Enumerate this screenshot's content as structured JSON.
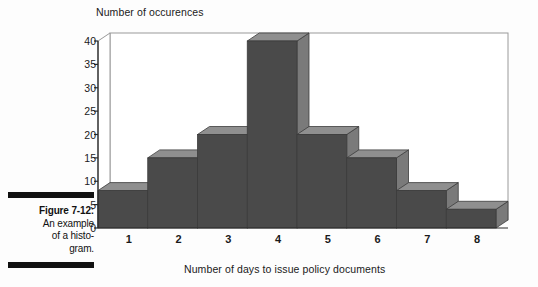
{
  "figure": {
    "label": "Figure 7-12:",
    "line1": "An example",
    "line2": "of a histo-",
    "line3": "gram."
  },
  "chart_data": {
    "type": "bar",
    "title": "",
    "subtitle": "",
    "xlabel": "Number of days to issue policy documents",
    "ylabel": "Number of occurences",
    "categories": [
      "1",
      "2",
      "3",
      "4",
      "5",
      "6",
      "7",
      "8"
    ],
    "values": [
      8,
      15,
      20,
      40,
      20,
      15,
      8,
      4
    ],
    "ylim": [
      0,
      40
    ],
    "ytick_labels": [
      "0",
      "5",
      "10",
      "15",
      "20",
      "25",
      "30",
      "35",
      "40"
    ],
    "ytick_values": [
      0,
      5,
      10,
      15,
      20,
      25,
      30,
      35,
      40
    ],
    "grid": false,
    "legend": false,
    "legend_position": "none",
    "style": "3d-bar",
    "colors": {
      "bar_front": "#4a4a4a",
      "bar_top": "#8f8f8f",
      "bar_side": "#7a7a7a",
      "plot_frame": "#9a9a9a",
      "axis": "#2a2a2a",
      "background": "#fdfdfd",
      "caption_rule": "#111111",
      "text": "#1a1a1a"
    }
  }
}
